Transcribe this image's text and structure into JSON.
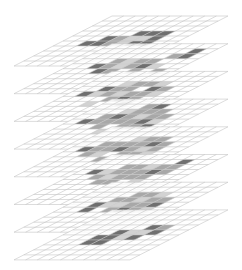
{
  "diagram": {
    "type": "stacked-isometric-grids",
    "layer_count": 8,
    "grid": {
      "rows": 10,
      "cols": 10
    },
    "geometry": {
      "origin_x": 112,
      "origin_y": 16,
      "col_dx": 11.6,
      "col_dy": 0,
      "row_dx": -9.8,
      "row_dy": 5,
      "layer_dy": 27.7
    },
    "colors": {
      "background": "#ffffff",
      "grid_line": "#c4c4c4",
      "level_1": "#d2d2d2",
      "level_2": "#a8a8a8",
      "level_3": "#6f6f6f"
    },
    "layers": [
      {
        "cells": [
          [
            3,
            5,
            3
          ],
          [
            3,
            6,
            3
          ],
          [
            3,
            7,
            3
          ],
          [
            4,
            3,
            3
          ],
          [
            4,
            4,
            2
          ],
          [
            4,
            5,
            1
          ],
          [
            4,
            6,
            1
          ],
          [
            4,
            7,
            3
          ],
          [
            5,
            2,
            3
          ],
          [
            5,
            3,
            3
          ],
          [
            5,
            4,
            2
          ],
          [
            5,
            5,
            1
          ],
          [
            5,
            6,
            3
          ],
          [
            5,
            7,
            3
          ]
        ]
      },
      {
        "cells": [
          [
            1,
            8,
            3
          ],
          [
            2,
            7,
            2
          ],
          [
            2,
            8,
            3
          ],
          [
            3,
            3,
            2
          ],
          [
            3,
            4,
            1
          ],
          [
            3,
            5,
            2
          ],
          [
            3,
            6,
            2
          ],
          [
            4,
            2,
            3
          ],
          [
            4,
            3,
            2
          ],
          [
            4,
            4,
            1
          ],
          [
            4,
            5,
            2
          ],
          [
            4,
            6,
            3
          ],
          [
            4,
            7,
            1
          ],
          [
            5,
            3,
            3
          ],
          [
            5,
            4,
            2
          ],
          [
            5,
            6,
            2
          ],
          [
            5,
            8,
            2
          ]
        ]
      },
      {
        "cells": [
          [
            2,
            3,
            1
          ],
          [
            2,
            4,
            2
          ],
          [
            2,
            5,
            2
          ],
          [
            2,
            6,
            1
          ],
          [
            3,
            2,
            3
          ],
          [
            3,
            3,
            2
          ],
          [
            3,
            4,
            2
          ],
          [
            3,
            6,
            3
          ],
          [
            3,
            7,
            2
          ],
          [
            4,
            1,
            3
          ],
          [
            4,
            2,
            1
          ],
          [
            4,
            3,
            2
          ],
          [
            4,
            4,
            1
          ],
          [
            4,
            5,
            2
          ],
          [
            4,
            6,
            2
          ],
          [
            4,
            7,
            1
          ],
          [
            5,
            4,
            2
          ],
          [
            5,
            5,
            3
          ],
          [
            5,
            6,
            2
          ],
          [
            6,
            3,
            1
          ],
          [
            6,
            6,
            2
          ]
        ]
      },
      {
        "cells": [
          [
            1,
            4,
            2
          ],
          [
            1,
            5,
            3
          ],
          [
            2,
            3,
            1
          ],
          [
            2,
            4,
            2
          ],
          [
            2,
            5,
            2
          ],
          [
            2,
            6,
            2
          ],
          [
            3,
            2,
            2
          ],
          [
            3,
            3,
            3
          ],
          [
            3,
            4,
            2
          ],
          [
            3,
            5,
            1
          ],
          [
            3,
            6,
            2
          ],
          [
            3,
            7,
            2
          ],
          [
            4,
            1,
            3
          ],
          [
            4,
            2,
            2
          ],
          [
            4,
            3,
            2
          ],
          [
            4,
            4,
            2
          ],
          [
            4,
            5,
            2
          ],
          [
            4,
            6,
            3
          ],
          [
            4,
            7,
            1
          ],
          [
            5,
            3,
            2
          ],
          [
            5,
            5,
            2
          ],
          [
            5,
            6,
            2
          ],
          [
            5,
            7,
            3
          ],
          [
            6,
            4,
            1
          ]
        ]
      },
      {
        "cells": [
          [
            2,
            4,
            1
          ],
          [
            2,
            5,
            2
          ],
          [
            2,
            6,
            2
          ],
          [
            3,
            2,
            2
          ],
          [
            3,
            3,
            2
          ],
          [
            3,
            4,
            2
          ],
          [
            3,
            5,
            2
          ],
          [
            3,
            6,
            3
          ],
          [
            3,
            7,
            2
          ],
          [
            4,
            1,
            3
          ],
          [
            4,
            2,
            2
          ],
          [
            4,
            3,
            2
          ],
          [
            4,
            4,
            3
          ],
          [
            4,
            5,
            2
          ],
          [
            4,
            6,
            1
          ],
          [
            4,
            7,
            2
          ],
          [
            5,
            2,
            2
          ],
          [
            5,
            3,
            1
          ],
          [
            5,
            5,
            2
          ],
          [
            5,
            6,
            2
          ],
          [
            5,
            7,
            1
          ],
          [
            6,
            4,
            2
          ]
        ]
      },
      {
        "cells": [
          [
            1,
            7,
            3
          ],
          [
            2,
            3,
            2
          ],
          [
            2,
            4,
            2
          ],
          [
            2,
            5,
            1
          ],
          [
            2,
            6,
            2
          ],
          [
            2,
            7,
            2
          ],
          [
            3,
            1,
            3
          ],
          [
            3,
            2,
            1
          ],
          [
            3,
            3,
            2
          ],
          [
            3,
            4,
            2
          ],
          [
            3,
            5,
            2
          ],
          [
            3,
            6,
            3
          ],
          [
            3,
            7,
            2
          ],
          [
            4,
            2,
            2
          ],
          [
            4,
            3,
            1
          ],
          [
            4,
            4,
            2
          ],
          [
            4,
            5,
            2
          ],
          [
            4,
            6,
            2
          ],
          [
            5,
            3,
            2
          ],
          [
            5,
            4,
            2
          ],
          [
            5,
            6,
            1
          ]
        ]
      },
      {
        "cells": [
          [
            2,
            4,
            2
          ],
          [
            2,
            5,
            2
          ],
          [
            2,
            6,
            1
          ],
          [
            3,
            3,
            2
          ],
          [
            3,
            4,
            2
          ],
          [
            3,
            5,
            1
          ],
          [
            3,
            6,
            2
          ],
          [
            3,
            7,
            2
          ],
          [
            4,
            2,
            3
          ],
          [
            4,
            3,
            1
          ],
          [
            4,
            4,
            1
          ],
          [
            4,
            5,
            2
          ],
          [
            4,
            6,
            2
          ],
          [
            4,
            7,
            3
          ],
          [
            5,
            2,
            3
          ],
          [
            5,
            4,
            2
          ],
          [
            5,
            5,
            3
          ],
          [
            5,
            6,
            2
          ],
          [
            5,
            7,
            1
          ]
        ]
      },
      {
        "cells": [
          [
            3,
            6,
            3
          ],
          [
            3,
            7,
            2
          ],
          [
            4,
            4,
            3
          ],
          [
            4,
            5,
            1
          ],
          [
            4,
            6,
            1
          ],
          [
            4,
            7,
            3
          ],
          [
            5,
            3,
            3
          ],
          [
            5,
            4,
            3
          ],
          [
            5,
            5,
            1
          ],
          [
            5,
            6,
            3
          ],
          [
            6,
            3,
            3
          ],
          [
            6,
            4,
            3
          ]
        ]
      }
    ]
  }
}
